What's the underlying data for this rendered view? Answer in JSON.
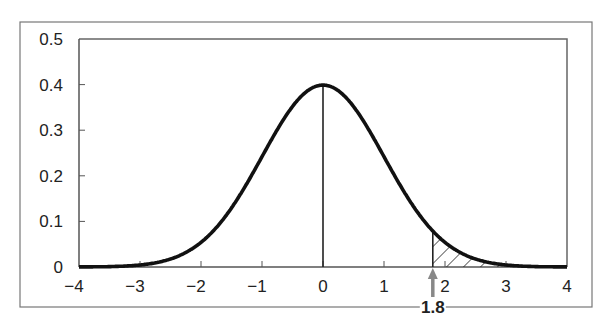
{
  "chart_data": {
    "type": "line",
    "title": "",
    "xlabel": "",
    "ylabel": "",
    "series": [
      {
        "name": "Standard normal density",
        "function": "normal_pdf",
        "mean": 0,
        "sd": 1
      }
    ],
    "xlim": [
      -4,
      4
    ],
    "ylim": [
      0,
      0.5
    ],
    "x_ticks": [
      -4,
      -3,
      -2,
      -1,
      0,
      1,
      2,
      3,
      4
    ],
    "x_tick_labels": [
      "−4",
      "−3",
      "−2",
      "−1",
      "0",
      "1",
      "2",
      "3",
      "4"
    ],
    "y_ticks": [
      0,
      0.1,
      0.2,
      0.3,
      0.4,
      0.5
    ],
    "y_tick_labels": [
      "0",
      "0.1",
      "0.2",
      "0.3",
      "0.4",
      "0.5"
    ],
    "sample_points": {
      "x": [
        -4,
        -3,
        -2,
        -1,
        0,
        1,
        2,
        3,
        4
      ],
      "y": [
        0.0001,
        0.0044,
        0.054,
        0.242,
        0.399,
        0.242,
        0.054,
        0.0044,
        0.0001
      ]
    },
    "annotations": [
      {
        "type": "vertical_line",
        "x": 0,
        "from": 0,
        "to": 0.399
      },
      {
        "type": "shaded_tail",
        "from_x": 1.8,
        "to_x": 4,
        "pattern": "hatch"
      },
      {
        "type": "arrow",
        "x": 1.8,
        "direction": "up",
        "label": "1.8",
        "color": "#888888"
      }
    ],
    "grid": false,
    "legend": "none",
    "colors": {
      "curve": "#111111",
      "axis": "#555555",
      "frame": "#666666",
      "arrow": "#888888"
    }
  }
}
